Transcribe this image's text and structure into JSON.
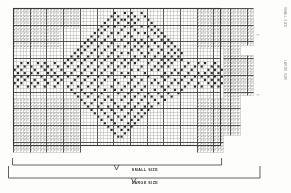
{
  "document": {
    "title": "Filet Crochet Pattern Chart",
    "kind": "counted-grid-pattern"
  },
  "labels": {
    "small_size": "SMALL SIZE",
    "large_size": "LARGE SIZE",
    "right_caption_top": "SMALL SIZE",
    "right_caption_mid": "LARGE SIZE"
  },
  "colors": {
    "paper": "#fdfdfb",
    "grid_line": "#8d8d8d",
    "grid_line_major": "#3a3a3a",
    "filled_cell": "#2a2a2a",
    "stipple": "#9a9a9a",
    "bracket": "#3a3a3a",
    "text": "#2b2b2b"
  },
  "chart_data": {
    "type": "heatmap",
    "title": "Filet Crochet Pattern Chart",
    "xlabel": "",
    "ylabel": "",
    "grid": true,
    "legend_position": "none",
    "cell_px": 3.34,
    "major_every": 5,
    "cols": 72,
    "rows": 43,
    "origin": {
      "x": 13.0,
      "y": 8.0
    },
    "annotations": [
      "SMALL SIZE",
      "LARGE SIZE"
    ],
    "regions": {
      "small_size_cols": [
        0,
        62
      ],
      "small_size_rows": [
        0,
        41
      ],
      "large_size_cols": [
        0,
        71
      ],
      "large_size_rows": [
        0,
        43
      ],
      "stipple_blocks": [
        {
          "c0": 0,
          "c1": 14,
          "r0": 0,
          "r1": 12,
          "note": "top-left mesh"
        },
        {
          "c0": 14,
          "c1": 20,
          "r0": 0,
          "r1": 6,
          "note": "top-left mesh step"
        },
        {
          "c0": 0,
          "c1": 20,
          "r0": 27,
          "r1": 43,
          "note": "bottom-left mesh"
        },
        {
          "c0": 55,
          "c1": 63,
          "r0": 0,
          "r1": 12,
          "note": "top-right mesh"
        },
        {
          "c0": 55,
          "c1": 63,
          "r0": 27,
          "r1": 43,
          "note": "bottom-right mesh"
        },
        {
          "c0": 63,
          "c1": 72,
          "r0": 0,
          "r1": 11,
          "note": "far-right extension top"
        },
        {
          "c0": 63,
          "c1": 68,
          "r0": 11,
          "r1": 38,
          "note": "far-right extension band"
        },
        {
          "c0": 63,
          "c1": 72,
          "r0": 14,
          "r1": 26,
          "note": "far-right extension mid"
        }
      ]
    },
    "filled_cells": [
      [
        30,
        1
      ],
      [
        33,
        1
      ],
      [
        35,
        1
      ],
      [
        38,
        1
      ],
      [
        29,
        2
      ],
      [
        31,
        2
      ],
      [
        34,
        2
      ],
      [
        36,
        2
      ],
      [
        39,
        2
      ],
      [
        28,
        3
      ],
      [
        30,
        3
      ],
      [
        32,
        3
      ],
      [
        33,
        3
      ],
      [
        35,
        3
      ],
      [
        37,
        3
      ],
      [
        40,
        3
      ],
      [
        27,
        4
      ],
      [
        31,
        4
      ],
      [
        34,
        4
      ],
      [
        36,
        4
      ],
      [
        41,
        4
      ],
      [
        26,
        5
      ],
      [
        28,
        5
      ],
      [
        30,
        5
      ],
      [
        33,
        5
      ],
      [
        35,
        5
      ],
      [
        38,
        5
      ],
      [
        40,
        5
      ],
      [
        42,
        5
      ],
      [
        25,
        6
      ],
      [
        27,
        6
      ],
      [
        32,
        6
      ],
      [
        36,
        6
      ],
      [
        41,
        6
      ],
      [
        43,
        6
      ],
      [
        24,
        7
      ],
      [
        26,
        7
      ],
      [
        29,
        7
      ],
      [
        31,
        7
      ],
      [
        34,
        7
      ],
      [
        37,
        7
      ],
      [
        39,
        7
      ],
      [
        42,
        7
      ],
      [
        44,
        7
      ],
      [
        23,
        8
      ],
      [
        25,
        8
      ],
      [
        28,
        8
      ],
      [
        33,
        8
      ],
      [
        35,
        8
      ],
      [
        40,
        8
      ],
      [
        43,
        8
      ],
      [
        45,
        8
      ],
      [
        22,
        9
      ],
      [
        24,
        9
      ],
      [
        27,
        9
      ],
      [
        30,
        9
      ],
      [
        32,
        9
      ],
      [
        36,
        9
      ],
      [
        38,
        9
      ],
      [
        41,
        9
      ],
      [
        44,
        9
      ],
      [
        46,
        9
      ],
      [
        21,
        10
      ],
      [
        23,
        10
      ],
      [
        26,
        10
      ],
      [
        29,
        10
      ],
      [
        34,
        10
      ],
      [
        37,
        10
      ],
      [
        39,
        10
      ],
      [
        42,
        10
      ],
      [
        45,
        10
      ],
      [
        47,
        10
      ],
      [
        20,
        11
      ],
      [
        22,
        11
      ],
      [
        25,
        11
      ],
      [
        28,
        11
      ],
      [
        31,
        11
      ],
      [
        33,
        11
      ],
      [
        36,
        11
      ],
      [
        38,
        11
      ],
      [
        40,
        11
      ],
      [
        43,
        11
      ],
      [
        46,
        11
      ],
      [
        48,
        11
      ],
      [
        19,
        12
      ],
      [
        21,
        12
      ],
      [
        24,
        12
      ],
      [
        27,
        12
      ],
      [
        30,
        12
      ],
      [
        35,
        12
      ],
      [
        37,
        12
      ],
      [
        41,
        12
      ],
      [
        44,
        12
      ],
      [
        47,
        12
      ],
      [
        49,
        12
      ],
      [
        18,
        13
      ],
      [
        20,
        13
      ],
      [
        23,
        13
      ],
      [
        26,
        13
      ],
      [
        29,
        13
      ],
      [
        32,
        13
      ],
      [
        34,
        13
      ],
      [
        38,
        13
      ],
      [
        40,
        13
      ],
      [
        43,
        13
      ],
      [
        46,
        13
      ],
      [
        48,
        13
      ],
      [
        50,
        13
      ],
      [
        17,
        14
      ],
      [
        19,
        14
      ],
      [
        22,
        14
      ],
      [
        25,
        14
      ],
      [
        28,
        14
      ],
      [
        31,
        14
      ],
      [
        36,
        14
      ],
      [
        39,
        14
      ],
      [
        42,
        14
      ],
      [
        45,
        14
      ],
      [
        47,
        14
      ],
      [
        49,
        14
      ],
      [
        16,
        15
      ],
      [
        18,
        15
      ],
      [
        21,
        15
      ],
      [
        24,
        15
      ],
      [
        27,
        15
      ],
      [
        30,
        15
      ],
      [
        33,
        15
      ],
      [
        35,
        15
      ],
      [
        37,
        15
      ],
      [
        41,
        15
      ],
      [
        44,
        15
      ],
      [
        46,
        15
      ],
      [
        48,
        15
      ],
      [
        50,
        15
      ],
      [
        2,
        16
      ],
      [
        4,
        16
      ],
      [
        7,
        16
      ],
      [
        9,
        16
      ],
      [
        12,
        16
      ],
      [
        15,
        16
      ],
      [
        17,
        16
      ],
      [
        20,
        16
      ],
      [
        23,
        16
      ],
      [
        26,
        16
      ],
      [
        29,
        16
      ],
      [
        32,
        16
      ],
      [
        34,
        16
      ],
      [
        36,
        16
      ],
      [
        40,
        16
      ],
      [
        43,
        16
      ],
      [
        45,
        16
      ],
      [
        47,
        16
      ],
      [
        52,
        16
      ],
      [
        55,
        16
      ],
      [
        57,
        16
      ],
      [
        60,
        16
      ],
      [
        1,
        17
      ],
      [
        3,
        17
      ],
      [
        5,
        17
      ],
      [
        8,
        17
      ],
      [
        10,
        17
      ],
      [
        13,
        17
      ],
      [
        16,
        17
      ],
      [
        19,
        17
      ],
      [
        22,
        17
      ],
      [
        25,
        17
      ],
      [
        28,
        17
      ],
      [
        31,
        17
      ],
      [
        33,
        17
      ],
      [
        38,
        17
      ],
      [
        42,
        17
      ],
      [
        44,
        17
      ],
      [
        46,
        17
      ],
      [
        51,
        17
      ],
      [
        54,
        17
      ],
      [
        56,
        17
      ],
      [
        59,
        17
      ],
      [
        61,
        17
      ],
      [
        0,
        18
      ],
      [
        2,
        18
      ],
      [
        6,
        18
      ],
      [
        9,
        18
      ],
      [
        11,
        18
      ],
      [
        14,
        18
      ],
      [
        18,
        18
      ],
      [
        21,
        18
      ],
      [
        24,
        18
      ],
      [
        27,
        18
      ],
      [
        30,
        18
      ],
      [
        35,
        18
      ],
      [
        37,
        18
      ],
      [
        41,
        18
      ],
      [
        43,
        18
      ],
      [
        48,
        18
      ],
      [
        50,
        18
      ],
      [
        53,
        18
      ],
      [
        58,
        18
      ],
      [
        60,
        18
      ],
      [
        62,
        18
      ],
      [
        1,
        19
      ],
      [
        3,
        19
      ],
      [
        5,
        19
      ],
      [
        7,
        19
      ],
      [
        10,
        19
      ],
      [
        12,
        19
      ],
      [
        15,
        19
      ],
      [
        17,
        19
      ],
      [
        20,
        19
      ],
      [
        23,
        19
      ],
      [
        26,
        19
      ],
      [
        29,
        19
      ],
      [
        32,
        19
      ],
      [
        34,
        19
      ],
      [
        39,
        19
      ],
      [
        45,
        19
      ],
      [
        47,
        19
      ],
      [
        49,
        19
      ],
      [
        52,
        19
      ],
      [
        55,
        19
      ],
      [
        57,
        19
      ],
      [
        59,
        19
      ],
      [
        61,
        19
      ],
      [
        0,
        20
      ],
      [
        2,
        20
      ],
      [
        4,
        20
      ],
      [
        8,
        20
      ],
      [
        11,
        20
      ],
      [
        13,
        20
      ],
      [
        16,
        20
      ],
      [
        19,
        20
      ],
      [
        22,
        20
      ],
      [
        25,
        20
      ],
      [
        28,
        20
      ],
      [
        33,
        20
      ],
      [
        36,
        20
      ],
      [
        40,
        20
      ],
      [
        44,
        20
      ],
      [
        46,
        20
      ],
      [
        51,
        20
      ],
      [
        54,
        20
      ],
      [
        56,
        20
      ],
      [
        58,
        20
      ],
      [
        60,
        20
      ],
      [
        62,
        20
      ],
      [
        1,
        21
      ],
      [
        3,
        21
      ],
      [
        6,
        21
      ],
      [
        9,
        21
      ],
      [
        12,
        21
      ],
      [
        14,
        21
      ],
      [
        18,
        21
      ],
      [
        21,
        21
      ],
      [
        24,
        21
      ],
      [
        27,
        21
      ],
      [
        30,
        21
      ],
      [
        35,
        21
      ],
      [
        38,
        21
      ],
      [
        42,
        21
      ],
      [
        45,
        21
      ],
      [
        48,
        21
      ],
      [
        50,
        21
      ],
      [
        53,
        21
      ],
      [
        57,
        21
      ],
      [
        59,
        21
      ],
      [
        61,
        21
      ],
      [
        0,
        22
      ],
      [
        2,
        22
      ],
      [
        5,
        22
      ],
      [
        7,
        22
      ],
      [
        10,
        22
      ],
      [
        13,
        22
      ],
      [
        17,
        22
      ],
      [
        20,
        22
      ],
      [
        23,
        22
      ],
      [
        26,
        22
      ],
      [
        31,
        22
      ],
      [
        34,
        22
      ],
      [
        37,
        22
      ],
      [
        41,
        22
      ],
      [
        43,
        22
      ],
      [
        47,
        22
      ],
      [
        49,
        22
      ],
      [
        52,
        22
      ],
      [
        55,
        22
      ],
      [
        58,
        22
      ],
      [
        60,
        22
      ],
      [
        62,
        22
      ],
      [
        1,
        23
      ],
      [
        4,
        23
      ],
      [
        6,
        23
      ],
      [
        9,
        23
      ],
      [
        12,
        23
      ],
      [
        16,
        23
      ],
      [
        19,
        23
      ],
      [
        22,
        23
      ],
      [
        25,
        23
      ],
      [
        29,
        23
      ],
      [
        33,
        23
      ],
      [
        36,
        23
      ],
      [
        39,
        23
      ],
      [
        44,
        23
      ],
      [
        46,
        23
      ],
      [
        51,
        23
      ],
      [
        54,
        23
      ],
      [
        56,
        23
      ],
      [
        59,
        23
      ],
      [
        61,
        23
      ],
      [
        17,
        24
      ],
      [
        20,
        24
      ],
      [
        24,
        24
      ],
      [
        27,
        24
      ],
      [
        30,
        24
      ],
      [
        32,
        24
      ],
      [
        35,
        24
      ],
      [
        38,
        24
      ],
      [
        42,
        24
      ],
      [
        45,
        24
      ],
      [
        48,
        24
      ],
      [
        50,
        24
      ],
      [
        18,
        25
      ],
      [
        21,
        25
      ],
      [
        23,
        25
      ],
      [
        26,
        25
      ],
      [
        31,
        25
      ],
      [
        34,
        25
      ],
      [
        37,
        25
      ],
      [
        40,
        25
      ],
      [
        43,
        25
      ],
      [
        46,
        25
      ],
      [
        49,
        25
      ],
      [
        19,
        26
      ],
      [
        22,
        26
      ],
      [
        25,
        26
      ],
      [
        28,
        26
      ],
      [
        33,
        26
      ],
      [
        36,
        26
      ],
      [
        39,
        26
      ],
      [
        41,
        26
      ],
      [
        44,
        26
      ],
      [
        47,
        26
      ],
      [
        20,
        27
      ],
      [
        24,
        27
      ],
      [
        27,
        27
      ],
      [
        29,
        27
      ],
      [
        32,
        27
      ],
      [
        35,
        27
      ],
      [
        38,
        27
      ],
      [
        42,
        27
      ],
      [
        45,
        27
      ],
      [
        21,
        28
      ],
      [
        23,
        28
      ],
      [
        26,
        28
      ],
      [
        30,
        28
      ],
      [
        34,
        28
      ],
      [
        37,
        28
      ],
      [
        40,
        28
      ],
      [
        43,
        28
      ],
      [
        22,
        29
      ],
      [
        25,
        29
      ],
      [
        28,
        29
      ],
      [
        31,
        29
      ],
      [
        33,
        29
      ],
      [
        36,
        29
      ],
      [
        39,
        29
      ],
      [
        41,
        29
      ],
      [
        23,
        30
      ],
      [
        26,
        30
      ],
      [
        29,
        30
      ],
      [
        32,
        30
      ],
      [
        35,
        30
      ],
      [
        38,
        30
      ],
      [
        40,
        30
      ],
      [
        24,
        31
      ],
      [
        27,
        31
      ],
      [
        30,
        31
      ],
      [
        34,
        31
      ],
      [
        37,
        31
      ],
      [
        39,
        31
      ],
      [
        25,
        32
      ],
      [
        28,
        32
      ],
      [
        31,
        32
      ],
      [
        33,
        32
      ],
      [
        36,
        32
      ],
      [
        38,
        32
      ],
      [
        26,
        33
      ],
      [
        29,
        33
      ],
      [
        32,
        33
      ],
      [
        35,
        33
      ],
      [
        37,
        33
      ],
      [
        27,
        34
      ],
      [
        30,
        34
      ],
      [
        34,
        34
      ],
      [
        36,
        34
      ],
      [
        28,
        35
      ],
      [
        31,
        35
      ],
      [
        33,
        35
      ],
      [
        35,
        35
      ],
      [
        29,
        36
      ],
      [
        32,
        36
      ],
      [
        34,
        36
      ],
      [
        30,
        37
      ],
      [
        33,
        37
      ],
      [
        31,
        38
      ],
      [
        32,
        38
      ]
    ]
  }
}
